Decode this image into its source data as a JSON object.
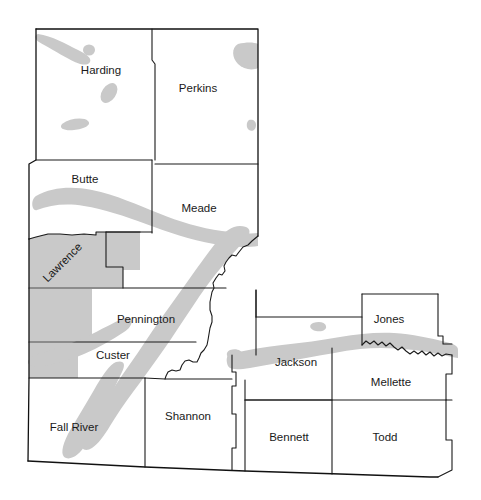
{
  "map": {
    "title": "Western South Dakota County Map with Aquifer Extent",
    "region": "South Dakota",
    "background_color": "#ffffff",
    "outline_color": "#1a1a1a",
    "shading_color": "#c9c9c9",
    "shading_meaning": "shaded-aquifer-area",
    "counties": [
      {
        "id": "harding",
        "label": "Harding",
        "label_x": 101,
        "label_y": 71,
        "rotation": 0,
        "shaded": false
      },
      {
        "id": "perkins",
        "label": "Perkins",
        "label_x": 198,
        "label_y": 89,
        "rotation": 0,
        "shaded": false
      },
      {
        "id": "butte",
        "label": "Butte",
        "label_x": 85,
        "label_y": 180,
        "rotation": 0,
        "shaded": false
      },
      {
        "id": "meade",
        "label": "Meade",
        "label_x": 199,
        "label_y": 209,
        "rotation": 0,
        "shaded": false
      },
      {
        "id": "lawrence",
        "label": "Lawrence",
        "label_x": 63,
        "label_y": 263,
        "rotation": -45,
        "shaded": true
      },
      {
        "id": "pennington",
        "label": "Pennington",
        "label_x": 146,
        "label_y": 320,
        "rotation": 0,
        "shaded": false
      },
      {
        "id": "custer",
        "label": "Custer",
        "label_x": 113,
        "label_y": 356,
        "rotation": 0,
        "shaded": false
      },
      {
        "id": "fall-river",
        "label": "Fall River",
        "label_x": 74,
        "label_y": 428,
        "rotation": 0,
        "shaded": false
      },
      {
        "id": "shannon",
        "label": "Shannon",
        "label_x": 188,
        "label_y": 417,
        "rotation": 0,
        "shaded": false
      },
      {
        "id": "jackson",
        "label": "Jackson",
        "label_x": 296,
        "label_y": 363,
        "rotation": 0,
        "shaded": false
      },
      {
        "id": "jones",
        "label": "Jones",
        "label_x": 389,
        "label_y": 320,
        "rotation": 0,
        "shaded": false
      },
      {
        "id": "mellette",
        "label": "Mellette",
        "label_x": 391,
        "label_y": 383,
        "rotation": 0,
        "shaded": false
      },
      {
        "id": "bennett",
        "label": "Bennett",
        "label_x": 289,
        "label_y": 438,
        "rotation": 0,
        "shaded": false
      },
      {
        "id": "todd",
        "label": "Todd",
        "label_x": 385,
        "label_y": 438,
        "rotation": 0,
        "shaded": false
      }
    ]
  }
}
